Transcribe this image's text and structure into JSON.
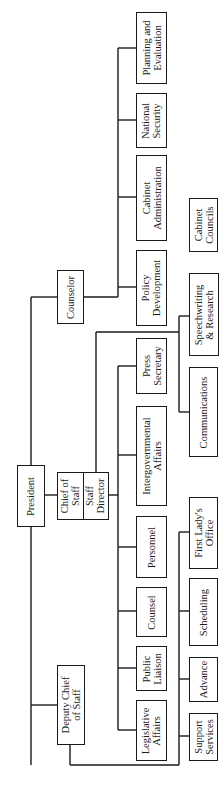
{
  "orientation": "rotated-90-ccw",
  "nodes": {
    "president": "President",
    "chief_of_staff": "Chief of\nStaff",
    "staff_director": "Staff\nDirector",
    "counselor": "Counselor",
    "deputy_chief": "Deputy Chief\nof Staff",
    "planning": "Planning and\nEvaluation",
    "national_security": "National\nSecurity",
    "cabinet_admin": "Cabinet\nAdministration",
    "policy_dev": "Policy\nDevelopment",
    "press": "Press\nSecretary",
    "intergov": "Intergovernmental\nAffairs",
    "personnel": "Personnel",
    "counsel": "Counsel",
    "public_liaison": "Public\nLiaison",
    "legislative": "Legislative\nAffairs",
    "cabinet_councils": "Cabinet\nCouncils",
    "speechwriting": "Speechwriting\n& Research",
    "communications": "Communications",
    "first_lady": "First Lady's\nOffice",
    "scheduling": "Scheduling",
    "advance": "Advance",
    "support": "Support\nServices"
  },
  "reporting": {
    "president": [
      "counselor",
      "chief_of_staff",
      "deputy_chief"
    ],
    "counselor": [
      "planning",
      "national_security",
      "cabinet_admin",
      "policy_dev"
    ],
    "chief_of_staff": [
      "press",
      "intergov",
      "personnel",
      "counsel",
      "public_liaison",
      "legislative",
      "speechwriting",
      "communications"
    ],
    "deputy_chief": [
      "first_lady",
      "scheduling",
      "advance",
      "support"
    ],
    "unconnected": [
      "cabinet_councils"
    ]
  }
}
